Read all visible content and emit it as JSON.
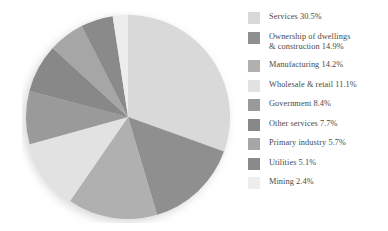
{
  "chart_data": {
    "type": "pie",
    "title": "",
    "subtitle": "",
    "xlabel": "",
    "ylabel": "",
    "units": "percent",
    "legend_position": "right",
    "grid": false,
    "start_angle_deg": 0,
    "direction": "clockwise",
    "categories": [
      "Services",
      "Ownership of dwellings & construction",
      "Manufacturing",
      "Wholesale & retail",
      "Government",
      "Other services",
      "Primary industry",
      "Utilities",
      "Mining"
    ],
    "values": [
      30.5,
      14.9,
      14.2,
      11.1,
      8.4,
      7.7,
      5.7,
      5.1,
      2.4
    ],
    "colors": [
      "#d9d9d9",
      "#8f8f8f",
      "#b0b0b0",
      "#e2e2e2",
      "#9a9a9a",
      "#888888",
      "#a6a6a6",
      "#8a8a8a",
      "#ededed"
    ]
  },
  "legend": {
    "items": [
      {
        "label": "Services 30.5%",
        "value": "30.5%",
        "name": "Services",
        "color": "#d9d9d9",
        "lines": 1
      },
      {
        "label": "Ownership of dwellings\n& construction 14.9%",
        "value": "14.9%",
        "name": "Ownership of dwellings & construction",
        "color": "#8f8f8f",
        "lines": 2
      },
      {
        "label": "Manufacturing 14.2%",
        "value": "14.2%",
        "name": "Manufacturing",
        "color": "#b0b0b0",
        "lines": 1
      },
      {
        "label": "Wholesale & retail 11.1%",
        "value": "11.1%",
        "name": "Wholesale & retail",
        "color": "#e2e2e2",
        "lines": 1
      },
      {
        "label": "Government 8.4%",
        "value": "8.4%",
        "name": "Government",
        "color": "#9a9a9a",
        "lines": 1
      },
      {
        "label": "Other services 7.7%",
        "value": "7.7%",
        "name": "Other services",
        "color": "#888888",
        "lines": 1
      },
      {
        "label": "Primary industry 5.7%",
        "value": "5.7%",
        "name": "Primary industry",
        "color": "#a6a6a6",
        "lines": 1
      },
      {
        "label": "Utilities 5.1%",
        "value": "5.1%",
        "name": "Utilities",
        "color": "#8a8a8a",
        "lines": 1
      },
      {
        "label": "Mining 2.4%",
        "value": "2.4%",
        "name": "Mining",
        "color": "#ededed",
        "lines": 1
      }
    ]
  },
  "colors": {
    "background": "#ffffff",
    "text": "#4a4a4a",
    "shadow": "#e6e6e6"
  }
}
